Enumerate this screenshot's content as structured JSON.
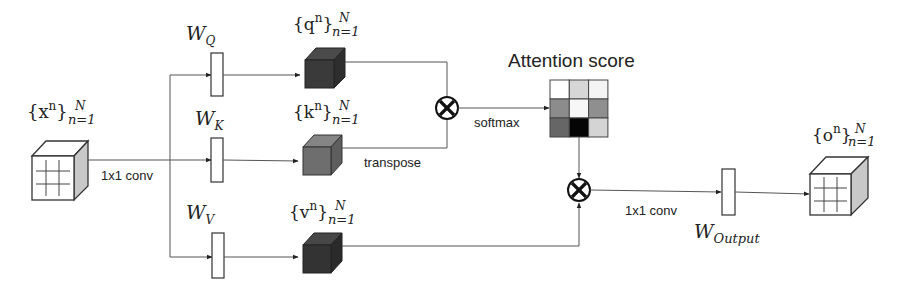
{
  "diagram": {
    "input": {
      "label_base": "{x",
      "label_sup": "n",
      "label_close": "}",
      "label_upper": "N",
      "label_lower": "n=1"
    },
    "input_conv_label": "1x1 conv",
    "weights": {
      "query": {
        "base": "W",
        "sub": "Q"
      },
      "key": {
        "base": "W",
        "sub": "K"
      },
      "value": {
        "base": "W",
        "sub": "V"
      },
      "output": {
        "base": "W",
        "sub": "Output"
      }
    },
    "tensors": {
      "query": {
        "label_base": "{q",
        "label_sup": "n",
        "label_close": "}",
        "label_upper": "N",
        "label_lower": "n=1",
        "color": "#3a3a3a"
      },
      "key": {
        "label_base": "{k",
        "label_sup": "n",
        "label_close": "}",
        "label_upper": "N",
        "label_lower": "n=1",
        "color": "#6e6e6e"
      },
      "value": {
        "label_base": "{v",
        "label_sup": "n",
        "label_close": "}",
        "label_upper": "N",
        "label_lower": "n=1",
        "color": "#333333"
      }
    },
    "transpose_label": "transpose",
    "softmax_label": "softmax",
    "attention": {
      "title": "Attention score",
      "cells": [
        [
          "#ffffff",
          "#d6d6d6",
          "#f4f4f4"
        ],
        [
          "#8c8c8c",
          "#f7f7f7",
          "#8f8f8f"
        ],
        [
          "#666666",
          "#050505",
          "#d4d4d4"
        ]
      ]
    },
    "output_conv_label": "1x1 conv",
    "output": {
      "label_base": "{o",
      "label_sup": "n",
      "label_close": "}",
      "label_upper": "N",
      "label_lower": "n=1"
    },
    "operators": {
      "matmul_top": "⊗",
      "matmul_bottom": "⊗"
    }
  }
}
